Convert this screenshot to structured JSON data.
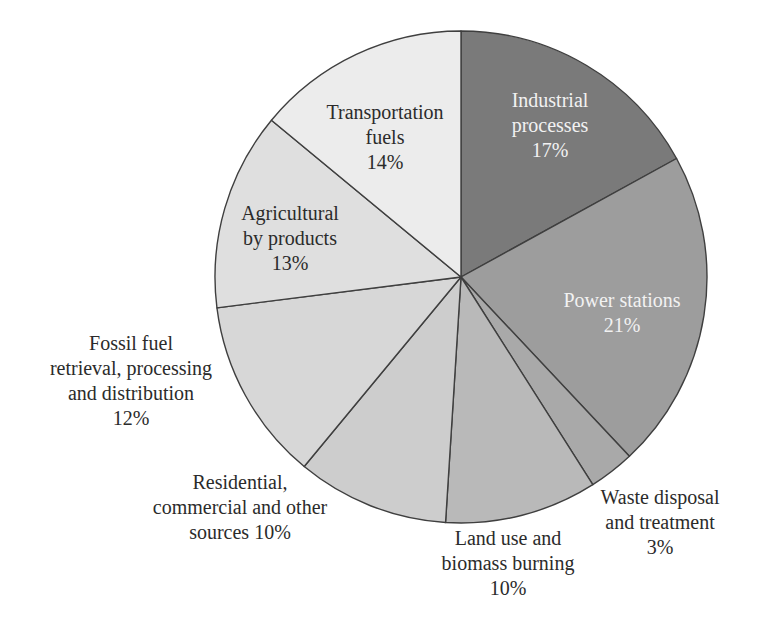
{
  "figure": {
    "background_color": "#ffffff",
    "description_label": "pie chart of emission sources"
  },
  "chart_data": {
    "type": "pie",
    "title": "",
    "legend": "none",
    "start_angle_deg": 0,
    "direction": "clockwise",
    "center": {
      "x": 461,
      "y": 277
    },
    "radius": 246,
    "stroke_color": "#3f3f3f",
    "stroke_width": 1.4,
    "label_line_height": 25,
    "categories": [
      "Industrial processes",
      "Power stations",
      "Waste disposal and treatment",
      "Land use and biomass burning",
      "Residential, commercial and other sources",
      "Fossil fuel retrieval, processing and distribution",
      "Agricultural by products",
      "Transportation fuels"
    ],
    "values": [
      17,
      21,
      3,
      10,
      10,
      12,
      13,
      14
    ],
    "slices": [
      {
        "label": "Industrial processes",
        "value_pct": 17,
        "color": "#7a7a7a",
        "label_inside": true,
        "label_color": "#f2f2f2",
        "label_lines": [
          "Industrial",
          "processes",
          "17%"
        ],
        "label_pos": {
          "x": 550,
          "y": 107
        }
      },
      {
        "label": "Power stations",
        "value_pct": 21,
        "color": "#9d9d9d",
        "label_inside": true,
        "label_color": "#f2f2f2",
        "label_lines": [
          "Power stations",
          "21%"
        ],
        "label_pos": {
          "x": 622,
          "y": 307
        }
      },
      {
        "label": "Waste disposal and treatment",
        "value_pct": 3,
        "color": "#a9a9a9",
        "label_inside": false,
        "label_color": "#2b2b2b",
        "label_lines": [
          "Waste disposal",
          "and treatment",
          "3%"
        ],
        "label_pos": {
          "x": 660,
          "y": 504
        }
      },
      {
        "label": "Land use and biomass burning",
        "value_pct": 10,
        "color": "#b9b9b9",
        "label_inside": false,
        "label_color": "#2b2b2b",
        "label_lines": [
          "Land use and",
          "biomass burning",
          "10%"
        ],
        "label_pos": {
          "x": 508,
          "y": 545
        }
      },
      {
        "label": "Residential, commercial and other sources",
        "value_pct": 10,
        "color": "#cdcdcd",
        "label_inside": false,
        "label_color": "#2b2b2b",
        "label_lines": [
          "Residential,",
          "commercial and other",
          "sources 10%"
        ],
        "label_pos": {
          "x": 240,
          "y": 489
        }
      },
      {
        "label": "Fossil fuel retrieval, processing and distribution",
        "value_pct": 12,
        "color": "#d7d7d7",
        "label_inside": false,
        "label_color": "#2b2b2b",
        "label_lines": [
          "Fossil fuel",
          "retrieval, processing",
          "and distribution",
          "12%"
        ],
        "label_pos": {
          "x": 131,
          "y": 350
        }
      },
      {
        "label": "Agricultural by products",
        "value_pct": 13,
        "color": "#dfdfdf",
        "label_inside": true,
        "label_color": "#2b2b2b",
        "label_lines": [
          "Agricultural",
          "by products",
          "13%"
        ],
        "label_pos": {
          "x": 290,
          "y": 220
        }
      },
      {
        "label": "Transportation fuels",
        "value_pct": 14,
        "color": "#ececec",
        "label_inside": true,
        "label_color": "#2b2b2b",
        "label_lines": [
          "Transportation",
          "fuels",
          "14%"
        ],
        "label_pos": {
          "x": 385,
          "y": 119
        }
      }
    ]
  }
}
